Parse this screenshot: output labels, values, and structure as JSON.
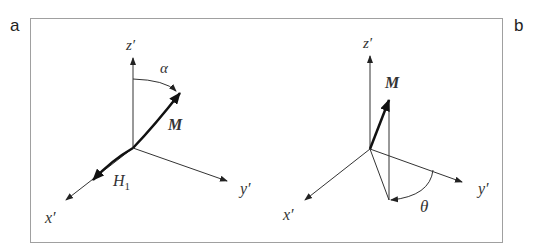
{
  "figure": {
    "panels": [
      {
        "id": "a",
        "letter": "a",
        "labels": {
          "z": "z′",
          "x": "x′",
          "y": "y′",
          "angle": "α",
          "vector": "M",
          "field": "H",
          "field_sub": "1"
        }
      },
      {
        "id": "b",
        "letter": "b",
        "labels": {
          "z": "z′",
          "x": "x′",
          "y": "y′",
          "angle": "θ",
          "vector": "M"
        }
      }
    ],
    "colors": {
      "frame": "#a0a0a0",
      "axis": "#333333",
      "vector": "#111111"
    }
  }
}
